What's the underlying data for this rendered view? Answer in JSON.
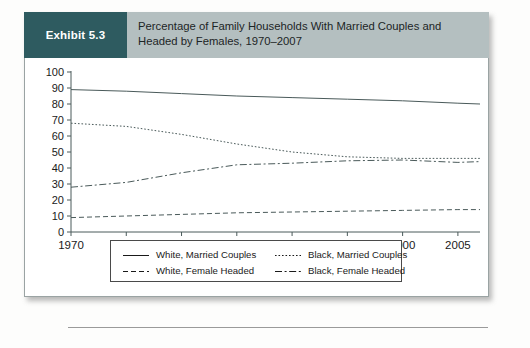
{
  "exhibit": {
    "badge_label": "Exhibit 5.3",
    "title_line1": "Percentage of Family Households With Married Couples and",
    "title_line2": "Headed by Females, 1970–2007",
    "badge_color": "#2e5b60",
    "header_color": "#b4bfc0"
  },
  "legend": {
    "items": [
      {
        "label": "White, Married Couples",
        "style": "solid",
        "column": 1,
        "row": 1
      },
      {
        "label": "Black, Married Couples",
        "style": "dotted",
        "column": 2,
        "row": 1
      },
      {
        "label": "White, Female Headed",
        "style": "dashed",
        "column": 1,
        "row": 2
      },
      {
        "label": "Black, Female Headed",
        "style": "dashdot",
        "column": 2,
        "row": 2
      }
    ]
  },
  "chart_data": {
    "type": "line",
    "title": "Percentage of Family Households With Married Couples and Headed by Females, 1970–2007",
    "xlabel": "",
    "ylabel": "",
    "xlim": [
      1970,
      2007
    ],
    "ylim": [
      0,
      100
    ],
    "ytick_values": [
      0,
      10,
      20,
      30,
      40,
      50,
      60,
      70,
      80,
      90,
      100
    ],
    "ytick_labels": [
      "0",
      "10",
      "20",
      "30",
      "40",
      "50",
      "60",
      "70",
      "80",
      "90",
      "100"
    ],
    "xtick_values": [
      1970,
      1975,
      1980,
      1985,
      1990,
      1995,
      2000,
      2005
    ],
    "xtick_labels": [
      "1970",
      "1975",
      "1980",
      "1985",
      "1990",
      "1995",
      "2000",
      "2005"
    ],
    "grid": false,
    "legend_position": "below-plot",
    "line_color": "#4a5a5a",
    "x": [
      1970,
      1975,
      1980,
      1985,
      1990,
      1995,
      2000,
      2005,
      2007
    ],
    "series": [
      {
        "name": "White, Married Couples",
        "style": "solid",
        "values": [
          89,
          88,
          86.5,
          85,
          84,
          83,
          82,
          80.5,
          80
        ]
      },
      {
        "name": "Black, Married Couples",
        "style": "dotted",
        "values": [
          68,
          66,
          61,
          55,
          50,
          47,
          46,
          46,
          46
        ]
      },
      {
        "name": "White, Female Headed",
        "style": "dashed",
        "values": [
          9,
          10,
          11,
          12,
          12.5,
          13,
          13.5,
          14,
          14
        ]
      },
      {
        "name": "Black, Female Headed",
        "style": "dashdot",
        "values": [
          28,
          31,
          37,
          42,
          43,
          44.5,
          45,
          43.5,
          44
        ]
      }
    ]
  }
}
